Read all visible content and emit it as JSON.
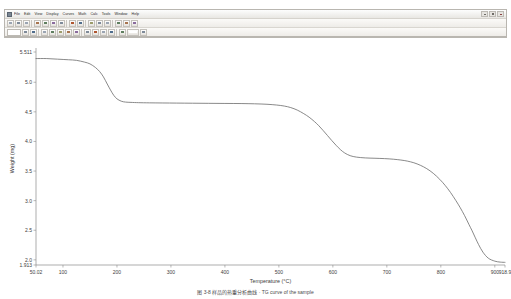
{
  "window": {
    "app_icon": "application-icon",
    "controls": [
      {
        "name": "minimize-button",
        "glyph": "minimize-icon"
      },
      {
        "name": "maximize-button",
        "glyph": "maximize-icon"
      },
      {
        "name": "close-button",
        "glyph": "close-icon"
      }
    ]
  },
  "menu": {
    "items": [
      {
        "label": "File"
      },
      {
        "label": "Edit"
      },
      {
        "label": "View"
      },
      {
        "label": "Display"
      },
      {
        "label": "Curves"
      },
      {
        "label": "Math"
      },
      {
        "label": "Calc"
      },
      {
        "label": "Tools"
      },
      {
        "label": "Window"
      },
      {
        "label": "Help"
      }
    ]
  },
  "toolbar_row1": {
    "buttons": [
      {
        "name": "new-icon"
      },
      {
        "name": "open-icon"
      },
      {
        "name": "save-icon"
      },
      {
        "name": "print-icon"
      },
      {
        "name": "print-preview-icon"
      },
      {
        "name": "cut-icon"
      },
      {
        "name": "copy-icon"
      },
      {
        "name": "paste-icon"
      },
      {
        "name": "undo-icon"
      },
      {
        "name": "zoom-in-icon"
      },
      {
        "name": "zoom-out-icon"
      },
      {
        "name": "rescale-icon"
      },
      {
        "name": "crosshair-icon"
      },
      {
        "name": "analyze-icon"
      },
      {
        "name": "help-icon"
      }
    ]
  },
  "toolbar_row2": {
    "buttons": [
      {
        "name": "signal-select-icon"
      },
      {
        "name": "axis-x-icon"
      },
      {
        "name": "axis-y-icon"
      },
      {
        "name": "curve-style-icon"
      },
      {
        "name": "grid-toggle-icon"
      },
      {
        "name": "legend-toggle-icon"
      },
      {
        "name": "derivative-icon"
      },
      {
        "name": "integral-icon"
      },
      {
        "name": "smooth-icon"
      },
      {
        "name": "baseline-icon"
      },
      {
        "name": "onset-icon"
      },
      {
        "name": "peak-icon"
      },
      {
        "name": "step-transition-icon"
      },
      {
        "name": "label-icon"
      },
      {
        "name": "report-icon"
      }
    ]
  },
  "chart_data": {
    "type": "line",
    "title": "",
    "xlabel": "Temperature (°C)",
    "ylabel": "Weight (mg)",
    "xlim": [
      50.02,
      918.9
    ],
    "ylim": [
      1.913,
      5.511
    ],
    "x_ticks": [
      "50.02",
      "100",
      "200",
      "300",
      "400",
      "500",
      "600",
      "700",
      "800",
      "900",
      "918.9"
    ],
    "x_tick_values": [
      50.02,
      100,
      200,
      300,
      400,
      500,
      600,
      700,
      800,
      900,
      918.9
    ],
    "y_ticks": [
      "5.511",
      "5.0",
      "4.5",
      "4.0",
      "3.5",
      "3.0",
      "2.5",
      "2.0",
      "1.913"
    ],
    "y_tick_values": [
      5.511,
      5.0,
      4.5,
      4.0,
      3.5,
      3.0,
      2.5,
      2.0,
      1.913
    ],
    "grid": false,
    "legend": "none",
    "line_color": "#6b6b6b",
    "series": [
      {
        "name": "Weight",
        "x": [
          50.02,
          70,
          90,
          110,
          125,
          140,
          150,
          160,
          168,
          175,
          182,
          188,
          194,
          200,
          208,
          216,
          226,
          240,
          260,
          285,
          310,
          340,
          370,
          400,
          430,
          455,
          478,
          496,
          510,
          522,
          534,
          546,
          556,
          566,
          574,
          582,
          590,
          598,
          606,
          614,
          622,
          632,
          644,
          660,
          678,
          696,
          712,
          726,
          738,
          750,
          762,
          774,
          786,
          798,
          808,
          818,
          828,
          836,
          844,
          852,
          858,
          864,
          870,
          878,
          888,
          900,
          910,
          918.9
        ],
        "y": [
          5.4,
          5.4,
          5.39,
          5.38,
          5.37,
          5.34,
          5.31,
          5.25,
          5.18,
          5.09,
          4.97,
          4.87,
          4.78,
          4.72,
          4.68,
          4.665,
          4.66,
          4.655,
          4.652,
          4.65,
          4.648,
          4.646,
          4.644,
          4.642,
          4.64,
          4.636,
          4.628,
          4.615,
          4.598,
          4.572,
          4.53,
          4.47,
          4.41,
          4.335,
          4.265,
          4.185,
          4.1,
          4.015,
          3.935,
          3.862,
          3.805,
          3.76,
          3.735,
          3.722,
          3.716,
          3.71,
          3.7,
          3.686,
          3.668,
          3.64,
          3.598,
          3.54,
          3.462,
          3.36,
          3.258,
          3.138,
          3.0,
          2.88,
          2.748,
          2.6,
          2.49,
          2.372,
          2.258,
          2.13,
          2.028,
          1.978,
          1.962,
          1.958
        ]
      }
    ],
    "annotations": []
  },
  "caption": {
    "text": "图 3-8    样品的热重分析曲线  ·  TG curve of the sample"
  }
}
